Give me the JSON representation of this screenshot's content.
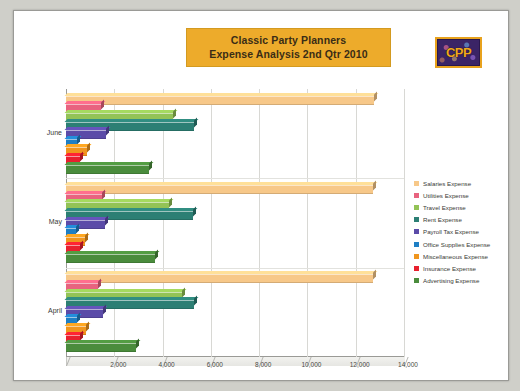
{
  "title": {
    "line1": "Classic Party Planners",
    "line2": "Expense Analysis 2nd Qtr 2010",
    "banner_color": "#edab2b"
  },
  "logo": {
    "text": "CPP",
    "border_color": "#e8a21d",
    "background_color": "#3b2466"
  },
  "chart_data": {
    "type": "bar",
    "orientation": "horizontal",
    "title": "Classic Party Planners Expense Analysis 2nd Qtr 2010",
    "xlabel": "",
    "ylabel": "",
    "categories": [
      "June",
      "May",
      "April"
    ],
    "xlim": [
      0,
      14000
    ],
    "xticks": [
      0,
      2000,
      4000,
      6000,
      8000,
      10000,
      12000,
      14000
    ],
    "xtick_labels": [
      "",
      "2,000",
      "4,000",
      "6,000",
      "8,000",
      "10,000",
      "12,000",
      "14,000"
    ],
    "grid": true,
    "legend_position": "right",
    "series": [
      {
        "name": "Salaries Expense",
        "color": "#f7c889",
        "values": [
          12770,
          12700,
          12700
        ]
      },
      {
        "name": "Utilities Expense",
        "color": "#e8637f",
        "values": [
          1450,
          1500,
          1320
        ]
      },
      {
        "name": "Travel Expense",
        "color": "#93c356",
        "values": [
          4450,
          4250,
          4800
        ]
      },
      {
        "name": "Rent Expense",
        "color": "#2c7f74",
        "values": [
          5300,
          5250,
          5300
        ]
      },
      {
        "name": "Payroll Tax Expense",
        "color": "#5b4ba8",
        "values": [
          1650,
          1600,
          1530
        ]
      },
      {
        "name": "Office Supplies Expense",
        "color": "#1f7fc4",
        "values": [
          470,
          430,
          450
        ]
      },
      {
        "name": "Miscellaneous Expense",
        "color": "#f0961e",
        "values": [
          850,
          800,
          820
        ]
      },
      {
        "name": "Insurance Expense",
        "color": "#e8202e",
        "values": [
          600,
          560,
          580
        ]
      },
      {
        "name": "Advertising Expense",
        "color": "#4a8c3c",
        "values": [
          3450,
          3700,
          2900
        ]
      }
    ]
  }
}
